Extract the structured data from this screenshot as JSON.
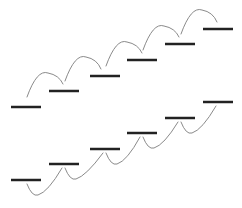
{
  "diagram": {
    "width": 242,
    "height": 208,
    "bar_color": "#222222",
    "arc_color": "#8a8a8a",
    "bar_length": 30,
    "bar_thickness": 2.5,
    "arc_thickness": 1,
    "top_staircase": {
      "arc_direction": "up",
      "bars": [
        {
          "x": 11,
          "y": 107
        },
        {
          "x": 49,
          "y": 91
        },
        {
          "x": 90,
          "y": 76
        },
        {
          "x": 127,
          "y": 60
        },
        {
          "x": 165,
          "y": 44
        },
        {
          "x": 203,
          "y": 29
        }
      ]
    },
    "bottom_staircase": {
      "arc_direction": "down",
      "bars": [
        {
          "x": 11,
          "y": 180
        },
        {
          "x": 49,
          "y": 164
        },
        {
          "x": 90,
          "y": 149
        },
        {
          "x": 127,
          "y": 133
        },
        {
          "x": 165,
          "y": 118
        },
        {
          "x": 203,
          "y": 102
        }
      ]
    }
  }
}
